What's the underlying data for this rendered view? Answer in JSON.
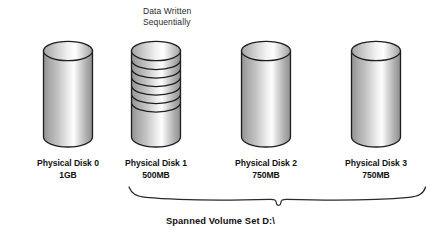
{
  "diagram": {
    "title_hidden": "",
    "annotation": {
      "text": "Data Written\nSequentially"
    },
    "set_label": "Spanned Volume Set D:\\",
    "brace": {
      "name": "curly-brace",
      "covers": [
        "Physical Disk 1",
        "Physical Disk 2",
        "Physical Disk 3"
      ]
    },
    "disks": [
      {
        "name": "Physical Disk 0",
        "capacity": "1GB",
        "striped": false,
        "in_volume_set": false
      },
      {
        "name": "Physical Disk 1",
        "capacity": "500MB",
        "striped": true,
        "stripe_count": 6,
        "in_volume_set": true
      },
      {
        "name": "Physical Disk 2",
        "capacity": "750MB",
        "striped": false,
        "in_volume_set": true
      },
      {
        "name": "Physical Disk 3",
        "capacity": "750MB",
        "striped": false,
        "in_volume_set": true
      }
    ],
    "colors": {
      "outline": "#1f1f1f",
      "gradient_dark": "#8f8f8f",
      "gradient_mid": "#c9c9c9",
      "gradient_light": "#fdfdfd",
      "text": "#111111",
      "annotation_text": "#2b2b2b",
      "background": "#ffffff"
    }
  }
}
